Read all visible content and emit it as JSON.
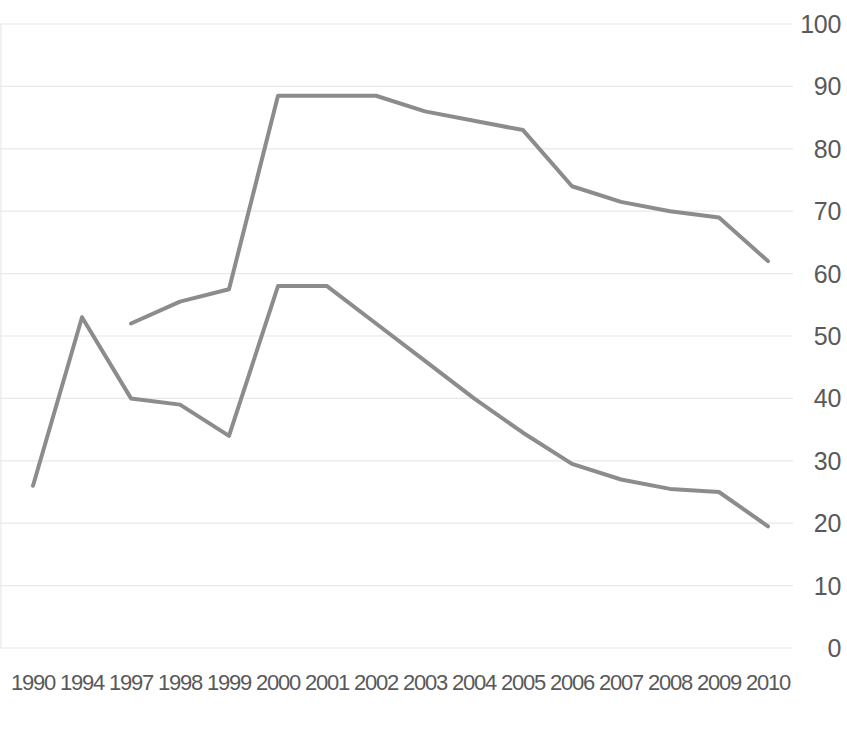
{
  "chart_data": {
    "type": "line",
    "title": "",
    "subtitle": "",
    "xlabel": "",
    "ylabel": "",
    "ylim": [
      0,
      100
    ],
    "ytick_step": 10,
    "yticks": [
      "0",
      "10",
      "20",
      "30",
      "40",
      "50",
      "60",
      "70",
      "80",
      "90",
      "100"
    ],
    "grid": true,
    "grid_axis": "y",
    "legend": "none",
    "categories": [
      "1990",
      "1994",
      "1997",
      "1998",
      "1999",
      "2000",
      "2001",
      "2002",
      "2003",
      "2004",
      "2005",
      "2006",
      "2007",
      "2008",
      "2009",
      "2010"
    ],
    "series": [
      {
        "name": "Series 1",
        "color": "#8c8c8c",
        "values": [
          26,
          53,
          40,
          39,
          34,
          58,
          58,
          52,
          46,
          40,
          34.5,
          29.5,
          27,
          25.5,
          25,
          19.5
        ]
      },
      {
        "name": "Series 2",
        "color": "#8c8c8c",
        "values": [
          null,
          null,
          52,
          55.5,
          57.5,
          88.5,
          88.5,
          88.5,
          86,
          84.5,
          83,
          74,
          71.5,
          70,
          69,
          62
        ]
      }
    ]
  },
  "style": {
    "line_color": "#8c8c8c",
    "grid_color": "#e8e8e8",
    "text_color": "#595959",
    "background": "#ffffff",
    "line_width": 4
  }
}
